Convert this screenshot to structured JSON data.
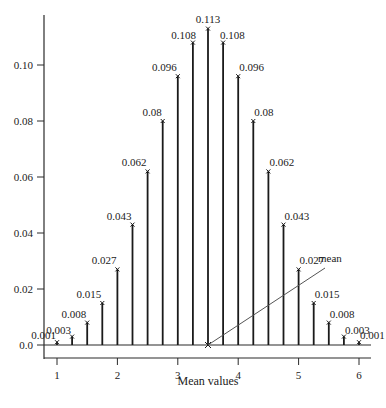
{
  "chart_data": {
    "type": "bar",
    "subtype": "stem",
    "title": "",
    "xlabel": "Mean values",
    "ylabel": "",
    "xlim": [
      0.9,
      6.2
    ],
    "ylim": [
      0.0,
      0.12
    ],
    "grid": false,
    "x_ticks": [
      1,
      2,
      3,
      4,
      5,
      6
    ],
    "y_ticks": [
      0.0,
      0.02,
      0.04,
      0.06,
      0.08,
      0.1
    ],
    "y_tick_labels": [
      "0.0",
      "0.02",
      "0.04",
      "0.06",
      "0.08",
      "0.10"
    ],
    "x": [
      1.0,
      1.25,
      1.5,
      1.75,
      2.0,
      2.25,
      2.5,
      2.75,
      3.0,
      3.25,
      3.5,
      3.75,
      4.0,
      4.25,
      4.5,
      4.75,
      5.0,
      5.25,
      5.5,
      5.75,
      6.0
    ],
    "values": [
      0.001,
      0.003,
      0.008,
      0.015,
      0.027,
      0.043,
      0.062,
      0.08,
      0.096,
      0.108,
      0.113,
      0.108,
      0.096,
      0.08,
      0.062,
      0.043,
      0.027,
      0.015,
      0.008,
      0.003,
      0.001
    ],
    "labels": [
      "0.001",
      "0.003",
      "0.008",
      "0.015",
      "0.027",
      "0.043",
      "0.062",
      "0.08",
      "0.096",
      "0.108",
      "0.113",
      "0.108",
      "0.096",
      "0.08",
      "0.062",
      "0.043",
      "0.027",
      "0.015",
      "0.008",
      "0.003",
      "0.001"
    ],
    "annotations": [
      {
        "text": "mean",
        "x": 3.5,
        "y": 0.0
      }
    ]
  },
  "colors": {
    "stem": "#1a1a1a",
    "axis": "#2a2a2a",
    "text": "#222222",
    "annotation_line": "#555555"
  }
}
